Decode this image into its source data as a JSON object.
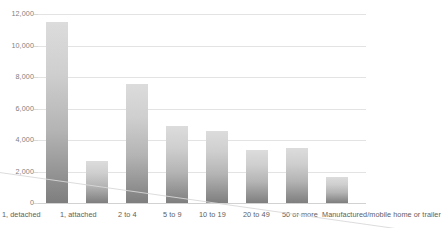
{
  "chart_data": {
    "type": "bar",
    "title": "",
    "subtitle": "",
    "xlabel": "",
    "ylabel": "",
    "grid": true,
    "legend": "none",
    "ylim": [
      0,
      12000
    ],
    "yticks": [
      "0",
      "2,000",
      "4,000",
      "6,000",
      "8,000",
      "10,000",
      "12,000"
    ],
    "ytick_values": [
      0,
      2000,
      4000,
      6000,
      8000,
      10000,
      12000
    ],
    "categories": [
      "1, detached",
      "1, attached",
      "2 to 4",
      "5 to 9",
      "10 to 19",
      "20 to 49",
      "50 or more",
      "Manufactured/mobile home or trailer"
    ],
    "values": [
      11500,
      2670,
      7550,
      4900,
      4570,
      3360,
      3500,
      1650
    ],
    "bar_color_top": "#dcdcdc",
    "bar_color_bottom": "#7e7e7e",
    "gridline_color": "#e3e3e3",
    "axis_text_color": "#7f7f7f",
    "category_text_color": "#5e5e5e"
  }
}
